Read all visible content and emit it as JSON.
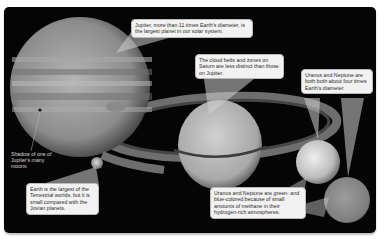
{
  "figure": {
    "background_color": "#050505",
    "planets": [
      {
        "name": "Jupiter",
        "color": "#9a9a9a"
      },
      {
        "name": "Saturn",
        "color": "#b8b8b8"
      },
      {
        "name": "Uranus",
        "color": "#c9c9c9"
      },
      {
        "name": "Neptune",
        "color": "#8a8a8a"
      },
      {
        "name": "Earth",
        "color": "#a9a9a9"
      }
    ],
    "callouts": {
      "jupiter": "Jupiter, more than 11 times Earth's diameter, is the largest planet in our solar system.",
      "saturn": "The cloud belts and zones on Saturn are less distinct than those on Jupiter.",
      "uranus_neptune_size": "Uranus and Neptune are both both about four times Earth's diameter.",
      "uranus_neptune_color": "Uranus and Neptune are green- and blue-colored because of small amounts of methane in their hydrogen-rich atmospheres.",
      "earth": "Earth is the largest of the Terrestrial worlds, but it is small compared with the Jovian planets."
    },
    "labels": {
      "moon_shadow": "Shadow of one of Jupiter's many moons"
    }
  }
}
